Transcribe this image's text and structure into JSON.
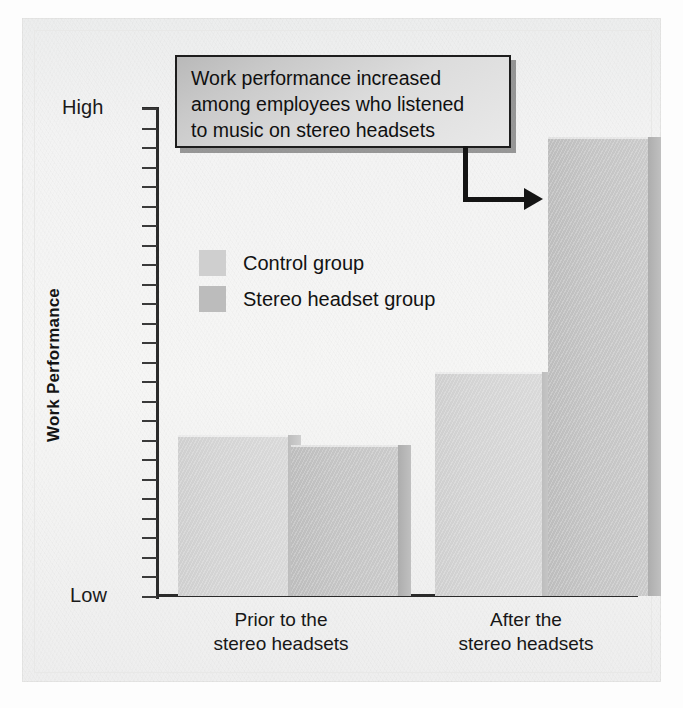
{
  "chart_data": {
    "type": "bar",
    "title": "",
    "xlabel": "",
    "ylabel": "Work Performance",
    "ylim": [
      0,
      100
    ],
    "y_tick_labels": {
      "high": "High",
      "low": "Low"
    },
    "y_tick_count": 26,
    "grid": false,
    "legend_position": "inside-upper-left",
    "categories": [
      "Prior to the\nstereo headsets",
      "After the\nstereo headsets"
    ],
    "category_lines": [
      [
        "Prior to the",
        "stereo headsets"
      ],
      [
        "After the",
        "stereo headsets"
      ]
    ],
    "series": [
      {
        "name": "Control group",
        "values": [
          33,
          46
        ],
        "color": "#d4d4d4"
      },
      {
        "name": "Stereo headset group",
        "values": [
          31,
          94
        ],
        "color": "#c3c3c3"
      }
    ],
    "annotations": [
      {
        "kind": "callout",
        "lines": [
          "Work performance increased",
          "among employees who listened",
          "to music on stereo headsets"
        ],
        "points_to": "After the stereo headsets — Stereo headset group bar"
      }
    ]
  },
  "axis": {
    "y_top_label": "High",
    "y_bottom_label": "Low",
    "y_title": "Work Performance"
  },
  "callout": {
    "line1": "Work performance increased",
    "line2": "among employees who listened",
    "line3": "to music on stereo headsets"
  },
  "legend": {
    "items": [
      {
        "label": "Control group",
        "swatch": "light-gray-swatch"
      },
      {
        "label": "Stereo headset group",
        "swatch": "dark-gray-swatch"
      }
    ]
  },
  "categories": {
    "group0_line1": "Prior to the",
    "group0_line2": "stereo headsets",
    "group1_line1": "After the",
    "group1_line2": "stereo headsets"
  },
  "colors": {
    "bar_control": "#d4d4d4",
    "bar_stereo": "#c3c3c3",
    "axis": "#2b2b2b",
    "callout_border": "#1d1d1d",
    "paper": "#f3f3f3"
  }
}
